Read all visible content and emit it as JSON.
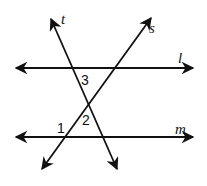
{
  "diagram": {
    "type": "parallel-lines-transversals",
    "stroke_color": "#111111",
    "background": "#ffffff",
    "lines": [
      {
        "name": "l",
        "label": "l",
        "kind": "parallel",
        "x1": 13,
        "y1": 68,
        "x2": 196,
        "y2": 68
      },
      {
        "name": "m",
        "label": "m",
        "kind": "parallel",
        "x1": 13,
        "y1": 137,
        "x2": 196,
        "y2": 137
      },
      {
        "name": "t",
        "label": "t",
        "kind": "transversal",
        "x1": 50,
        "y1": 16,
        "x2": 118,
        "y2": 172
      },
      {
        "name": "s",
        "label": "s",
        "kind": "transversal",
        "x1": 153,
        "y1": 15,
        "x2": 40,
        "y2": 172
      }
    ],
    "angles": [
      {
        "id": "1",
        "label": "1"
      },
      {
        "id": "2",
        "label": "2"
      },
      {
        "id": "3",
        "label": "3"
      }
    ]
  }
}
